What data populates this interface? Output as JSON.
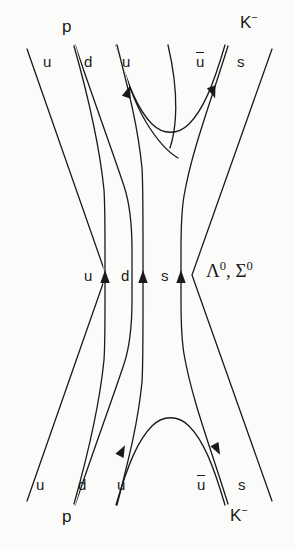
{
  "diagram": {
    "name": "quark-line-diagram",
    "background_color": "#fbfbf9",
    "line_color": "#1a1a1a",
    "line_width": 1.3
  },
  "labels": {
    "top_proton": "p",
    "top_kaon_letter": "K",
    "top_kaon_charge": "−",
    "top_quark_u1": "u",
    "top_quark_d": "d",
    "top_quark_u2": "u",
    "top_quark_ubar": "u",
    "top_quark_s": "s",
    "mid_quark_u": "u",
    "mid_quark_d": "d",
    "mid_quark_s": "s",
    "resonance_lambda": "Λ",
    "resonance_lambda_charge": "0",
    "resonance_separator": ", ",
    "resonance_sigma": "Σ",
    "resonance_sigma_charge": "0",
    "bottom_quark_u1": "u",
    "bottom_quark_d": "d",
    "bottom_quark_u2": "u",
    "bottom_quark_ubar": "u",
    "bottom_quark_s": "s",
    "bottom_proton": "p",
    "bottom_kaon_letter": "K",
    "bottom_kaon_charge": "−"
  }
}
